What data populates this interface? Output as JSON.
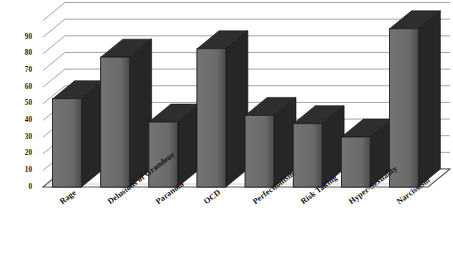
{
  "chart_data": {
    "type": "bar",
    "title": "",
    "subtitle": "",
    "xlabel": "",
    "ylabel": "",
    "ylim": [
      0,
      100
    ],
    "ytick_values": [
      0,
      10,
      20,
      30,
      40,
      50,
      60,
      70,
      80,
      90
    ],
    "ytick_labels": [
      "0",
      "10",
      "20",
      "30",
      "40",
      "50",
      "60",
      "70",
      "80",
      "90"
    ],
    "grid": true,
    "legend": "none",
    "style": "3d-bar-grayscale",
    "categories": [
      "Rage",
      "Delusions of Grandeur",
      "Paranoia",
      "OCD",
      "Perfectionism",
      "Risk Taking",
      "Hyper-Sexuality",
      "Narcissism"
    ],
    "values": [
      53,
      78,
      39,
      83,
      43,
      38,
      30,
      95
    ],
    "series": [
      {
        "name": "Traits",
        "values": [
          53,
          78,
          39,
          83,
          43,
          38,
          30,
          95
        ]
      }
    ]
  },
  "colors": {
    "bar_front": "#6d6d6d",
    "bar_side": "#262626",
    "bar_top": "#2e2e2e",
    "grid_line": "#8c8c8c",
    "floor": "#ffffff",
    "floor_edge": "#555555",
    "text": "#111111",
    "background": "#ffffff"
  }
}
